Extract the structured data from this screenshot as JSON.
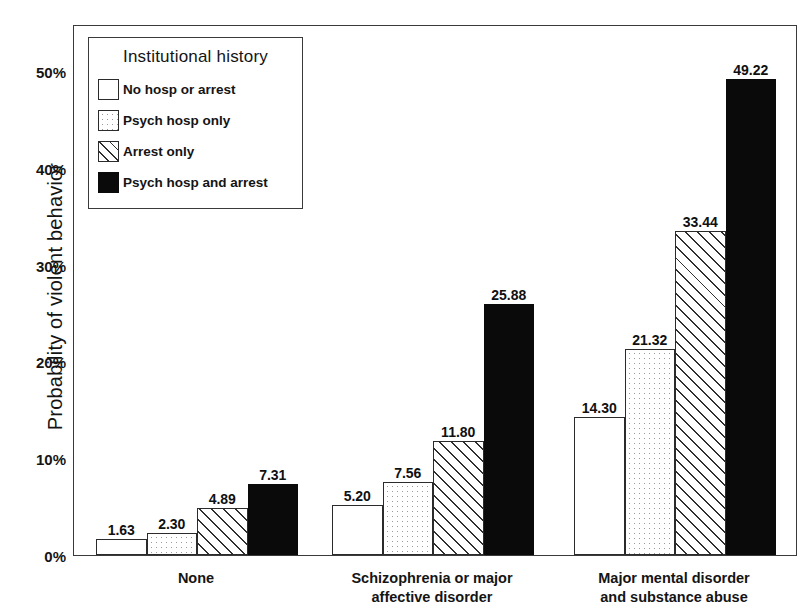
{
  "chart_data": {
    "type": "bar",
    "title": "",
    "subtitle": "",
    "xlabel": "",
    "ylabel": "Probability of violent behavior",
    "ylim": [
      0,
      52
    ],
    "ytick_values": [
      0,
      10,
      20,
      30,
      40,
      50
    ],
    "ytick_labels": [
      "0%",
      "10%",
      "20%",
      "30%",
      "40%",
      "50%"
    ],
    "grid": false,
    "legend_position": "upper-left-inside",
    "legend_title": "Institutional history",
    "categories": [
      "None",
      "Schizophrenia or major\naffective disorder",
      "Major mental disorder\nand substance abuse"
    ],
    "category_lines": [
      [
        "None"
      ],
      [
        "Schizophrenia or major",
        "affective disorder"
      ],
      [
        "Major mental disorder",
        "and substance abuse"
      ]
    ],
    "series": [
      {
        "name": "No hosp or arrest",
        "fill": "empty",
        "values": [
          1.63,
          2.3,
          14.3
        ],
        "labels": [
          "1.63",
          "2.30",
          "14.30"
        ]
      },
      {
        "name": "Psych hosp only",
        "fill": "dotted",
        "values": [
          2.3,
          7.56,
          21.32
        ],
        "labels": [
          "2.30",
          "7.56",
          "21.32"
        ]
      },
      {
        "name": "Arrest only",
        "fill": "hatch",
        "values": [
          4.89,
          11.8,
          33.44
        ],
        "labels": [
          "4.89",
          "11.80",
          "33.44"
        ]
      },
      {
        "name": "Psych hosp and arrest",
        "fill": "solid",
        "values": [
          7.31,
          25.88,
          49.22
        ],
        "labels": [
          "7.31",
          "25.88",
          "49.22"
        ]
      }
    ],
    "groups": [
      {
        "category": "None",
        "bars": [
          {
            "series": "No hosp or arrest",
            "value": 1.63,
            "label": "1.63",
            "fill": "empty"
          },
          {
            "series": "Psych hosp only",
            "value": 2.3,
            "label": "2.30",
            "fill": "dotted"
          },
          {
            "series": "Arrest only",
            "value": 4.89,
            "label": "4.89",
            "fill": "hatch"
          },
          {
            "series": "Psych hosp and arrest",
            "value": 7.31,
            "label": "7.31",
            "fill": "solid"
          }
        ]
      },
      {
        "category": "Schizophrenia or major affective disorder",
        "bars": [
          {
            "series": "No hosp or arrest",
            "value": 5.2,
            "label": "5.20",
            "fill": "empty"
          },
          {
            "series": "Psych hosp only",
            "value": 7.56,
            "label": "7.56",
            "fill": "dotted"
          },
          {
            "series": "Arrest only",
            "value": 11.8,
            "label": "11.80",
            "fill": "hatch"
          },
          {
            "series": "Psych hosp and arrest",
            "value": 25.88,
            "label": "25.88",
            "fill": "solid"
          }
        ]
      },
      {
        "category": "Major mental disorder and substance abuse",
        "bars": [
          {
            "series": "No hosp or arrest",
            "value": 14.3,
            "label": "14.30",
            "fill": "empty"
          },
          {
            "series": "Psych hosp only",
            "value": 21.32,
            "label": "21.32",
            "fill": "dotted"
          },
          {
            "series": "Arrest only",
            "value": 33.44,
            "label": "33.44",
            "fill": "hatch"
          },
          {
            "series": "Psych hosp and arrest",
            "value": 49.22,
            "label": "49.22",
            "fill": "solid"
          }
        ]
      }
    ],
    "colors": {
      "axis": "#3a3a3a",
      "bar_outline": "#2b2b2b",
      "solid_fill": "#0a0a0a",
      "hatch_line": "#2f2f2f",
      "dot_fill": "#9a9a9a",
      "background": "#ffffff",
      "text": "#141414"
    }
  },
  "legend": {
    "title": "Institutional history",
    "items": [
      {
        "label": "No hosp or arrest",
        "fill": "empty"
      },
      {
        "label": "Psych hosp only",
        "fill": "dotted"
      },
      {
        "label": "Arrest only",
        "fill": "hatch"
      },
      {
        "label": "Psych hosp and arrest",
        "fill": "solid"
      }
    ]
  },
  "axes": {
    "y_title": "Probability of violent behavior",
    "y_ticks": [
      "50%",
      "40%",
      "30%",
      "20%",
      "10%",
      "0%"
    ]
  }
}
